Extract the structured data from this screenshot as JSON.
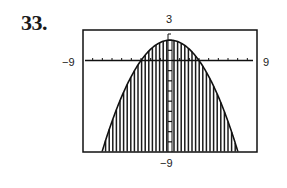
{
  "exercise_number": "33.",
  "chart_data": {
    "type": "area",
    "title": "",
    "function": "y = 2 - (2/9)x^2",
    "inequality": "y <= 2 - (2/9)x^2",
    "shading": "below curve",
    "window": {
      "xmin": -9,
      "xmax": 9,
      "ymin": -9,
      "ymax": 3
    },
    "xlim": [
      -9,
      9
    ],
    "ylim": [
      -9,
      3
    ],
    "x_tick_spacing": 1,
    "y_tick_spacing": 1,
    "window_labels": {
      "top": "3",
      "left": "-9",
      "right": "9",
      "bottom": "-9"
    },
    "key_points": [
      {
        "x": 0,
        "y": 2,
        "label": "vertex"
      },
      {
        "x": -3,
        "y": 0,
        "label": "x-intercept"
      },
      {
        "x": 3,
        "y": 0,
        "label": "x-intercept"
      },
      {
        "x": -7,
        "y": -8.9
      },
      {
        "x": 7,
        "y": -8.9
      }
    ],
    "x": [
      -7,
      -6,
      -5,
      -4,
      -3,
      -2,
      -1,
      0,
      1,
      2,
      3,
      4,
      5,
      6,
      7
    ],
    "values": [
      -8.89,
      -6,
      -3.56,
      -1.56,
      0,
      1.11,
      1.78,
      2,
      1.78,
      1.11,
      0,
      -1.56,
      -3.56,
      -6,
      -8.89
    ],
    "grid": false,
    "xlabel": "",
    "ylabel": ""
  }
}
